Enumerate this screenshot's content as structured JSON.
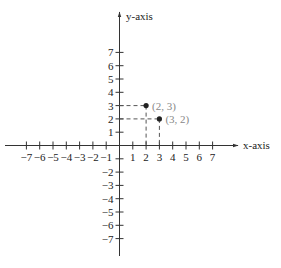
{
  "chart_data": {
    "type": "scatter",
    "title": "",
    "xlabel": "x-axis",
    "ylabel": "y-axis",
    "xlim": [
      -7,
      7
    ],
    "ylim": [
      -7,
      7
    ],
    "grid": false,
    "x_ticks": [
      -7,
      -6,
      -5,
      -4,
      -3,
      -2,
      -1,
      1,
      2,
      3,
      4,
      5,
      6,
      7
    ],
    "y_ticks": [
      -7,
      -6,
      -5,
      -4,
      -3,
      -2,
      1,
      2,
      3,
      4,
      5,
      6,
      7
    ],
    "points": [
      {
        "x": 2,
        "y": 3,
        "label": "(2, 3)"
      },
      {
        "x": 3,
        "y": 2,
        "label": "(3, 2)"
      }
    ],
    "annotations": [
      "dashed guide lines from each point to both axes"
    ]
  },
  "style": {
    "axis_color": "#333333",
    "point_color": "#222222",
    "point_label_color": "#888888"
  }
}
